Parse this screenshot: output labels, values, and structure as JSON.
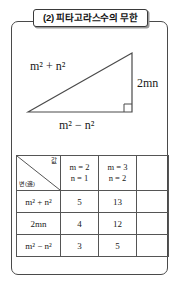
{
  "title": {
    "text": "(2) 피타고라스수의 무한"
  },
  "figure": {
    "type": "right-triangle",
    "hypotenuse_label": "m² + n²",
    "vertical_label": "2mn",
    "base_label": "m² − n²",
    "right_angle_marker": true,
    "stroke_color": "#4a4a4a"
  },
  "table": {
    "corner": {
      "top_right_label": "값",
      "bottom_left_label": "변(邊)"
    },
    "columns": [
      {
        "m": "m = 2",
        "n": "n = 1"
      },
      {
        "m": "m = 3",
        "n": "n = 2"
      },
      {
        "m": "",
        "n": ""
      }
    ],
    "rows": [
      {
        "side": "m² + n²",
        "values": [
          "5",
          "13",
          ""
        ]
      },
      {
        "side": "2mn",
        "values": [
          "4",
          "12",
          ""
        ]
      },
      {
        "side": "m² − n²",
        "values": [
          "3",
          "5",
          ""
        ]
      }
    ]
  }
}
